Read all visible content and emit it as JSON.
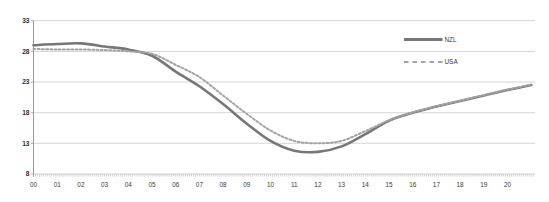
{
  "figure": {
    "background": "#ffffff"
  },
  "chart_data": {
    "type": "line",
    "title": "",
    "x": [
      0,
      1,
      2,
      3,
      4,
      5,
      6,
      7,
      8,
      9,
      10,
      11,
      12,
      13,
      14,
      15,
      16,
      17,
      18,
      19,
      20,
      21
    ],
    "x_tick_labels": [
      "00",
      "01",
      "02",
      "03",
      "04",
      "05",
      "06",
      "07",
      "08",
      "09",
      "10",
      "11",
      "12",
      "13",
      "14",
      "15",
      "16",
      "17",
      "18",
      "19",
      "20"
    ],
    "y_ticks": [
      33,
      28,
      23,
      18,
      13,
      8
    ],
    "y_tick_labels": [
      "33",
      "28",
      "23",
      "18",
      "13",
      "8"
    ],
    "ylim": [
      8,
      33
    ],
    "xlim": [
      0,
      21.2
    ],
    "grid": "horizontal-only",
    "minor_x_ticks_per_year": 12,
    "legend": {
      "position": "inside-right",
      "entries": [
        {
          "label": "NZL",
          "line_style": "solid"
        },
        {
          "label": "USA",
          "line_style": "dashed"
        }
      ]
    },
    "series": [
      {
        "name": "NZL",
        "line_style": "solid",
        "color": "#777777",
        "stroke_width": 2.6,
        "values": [
          29.0,
          29.2,
          29.3,
          28.8,
          28.3,
          27.3,
          24.7,
          22.3,
          19.4,
          16.2,
          13.4,
          11.8,
          11.6,
          12.5,
          14.5,
          16.7,
          18.0,
          19.0,
          19.9,
          20.8,
          21.7,
          22.5
        ]
      },
      {
        "name": "USA",
        "line_style": "dashed",
        "color": "#a3a3a3",
        "stroke_width": 2.0,
        "values": [
          28.4,
          28.3,
          28.3,
          28.2,
          28.0,
          27.6,
          25.8,
          23.8,
          20.8,
          17.8,
          15.1,
          13.4,
          13.0,
          13.4,
          15.0,
          16.75,
          18.05,
          19.05,
          19.95,
          20.85,
          21.75,
          22.55
        ]
      }
    ]
  },
  "colors": {
    "gridline": "#c9c9c9",
    "axis": "#999999",
    "minor_tick": "#a8a8a8",
    "label_text": "#3a3a3a"
  }
}
